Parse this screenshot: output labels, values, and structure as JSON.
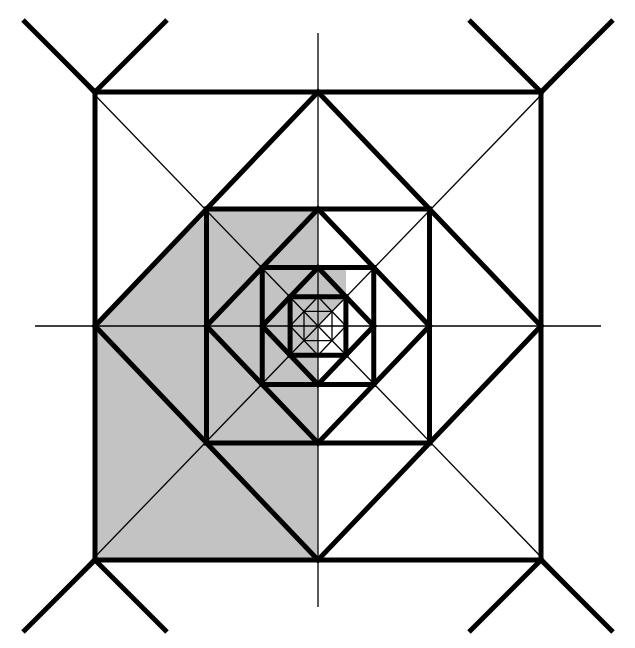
{
  "figure": {
    "kind": "geometric-diagram",
    "canvas": {
      "width": 635,
      "height": 648,
      "background": "#ffffff"
    },
    "center": {
      "x": 318,
      "y": 326
    },
    "colors": {
      "stroke": "#000000",
      "shade": "#c3c3c3",
      "background": "#ffffff"
    },
    "stroke_widths": {
      "thick": 5.0,
      "thin": 1.3
    },
    "outer_square": {
      "left": 95,
      "top": 92,
      "right": 541,
      "bottom": 560,
      "half_width": 223,
      "half_height": 234
    },
    "levels": [
      {
        "index": 0,
        "orientation": "axis-aligned",
        "half_w": 223,
        "half_h": 234,
        "weight": "thick"
      },
      {
        "index": 1,
        "orientation": "diamond",
        "half_w": 223,
        "half_h": 234,
        "weight": "thick"
      },
      {
        "index": 2,
        "orientation": "axis-aligned",
        "half_w": 111.5,
        "half_h": 117,
        "weight": "thick"
      },
      {
        "index": 3,
        "orientation": "diamond",
        "half_w": 111.5,
        "half_h": 117,
        "weight": "thick"
      },
      {
        "index": 4,
        "orientation": "axis-aligned",
        "half_w": 55.75,
        "half_h": 58.5,
        "weight": "thick"
      },
      {
        "index": 5,
        "orientation": "diamond",
        "half_w": 55.75,
        "half_h": 58.5,
        "weight": "thick"
      },
      {
        "index": 6,
        "orientation": "axis-aligned",
        "half_w": 27.9,
        "half_h": 29.3,
        "weight": "thick"
      },
      {
        "index": 7,
        "orientation": "diamond",
        "half_w": 27.9,
        "half_h": 29.3,
        "weight": "thin"
      },
      {
        "index": 8,
        "orientation": "axis-aligned",
        "half_w": 14.0,
        "half_h": 14.6,
        "weight": "thin"
      }
    ],
    "axis_lines": {
      "horizontal": {
        "x1": 35,
        "y1": 326,
        "x2": 601,
        "y2": 326,
        "weight": "thin"
      },
      "vertical": {
        "x1": 318,
        "y1": 33,
        "x2": 318,
        "y2": 607,
        "weight": "thin"
      }
    },
    "corner_crosses": {
      "description": "Thin and thick diagonal rays crossing through each corner of the outer square",
      "overshoot": 72,
      "corners": [
        {
          "name": "top-left",
          "x": 95,
          "y": 92
        },
        {
          "name": "top-right",
          "x": 541,
          "y": 92
        },
        {
          "name": "bottom-right",
          "x": 541,
          "y": 560
        },
        {
          "name": "bottom-left",
          "x": 95,
          "y": 560
        }
      ]
    },
    "thin_diagonals": [
      {
        "name": "main-diagonal-nwse",
        "x1": 35,
        "y1": 33,
        "x2": 601,
        "y2": 619
      },
      {
        "name": "main-diagonal-nesw",
        "x1": 601,
        "y1": 33,
        "x2": 35,
        "y2": 619
      }
    ],
    "shaded_region": {
      "color": "#c3c3c3",
      "description": "Self-similar shaded wedges occupying the left/lower-left quadrant sectors at successive scales",
      "pieces": [
        {
          "name": "outer-shaded-wedge",
          "points": "95,560 95,326 212,208 318,208 318,326 318,560"
        },
        {
          "name": "mid-shaded-wedge",
          "points": "212,208 318,208 318,326 265,267"
        },
        {
          "name": "inner-shaded-wedge",
          "points": "318,267 346,267 346,297 318,326"
        }
      ]
    }
  }
}
